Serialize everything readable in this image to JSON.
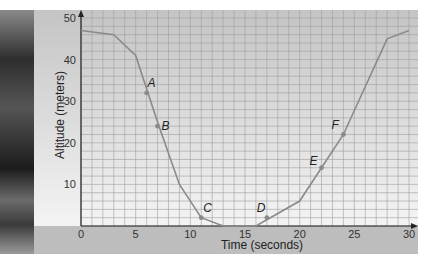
{
  "chart_data": {
    "type": "line",
    "title": "",
    "xlabel": "Time (seconds)",
    "ylabel": "Altitude (meters)",
    "xlim": [
      0,
      30
    ],
    "ylim": [
      0,
      50
    ],
    "xticks": [
      0,
      5,
      10,
      15,
      20,
      25,
      30
    ],
    "yticks": [
      10,
      20,
      30,
      40,
      50
    ],
    "grid": true,
    "legend": null,
    "series": [
      {
        "name": "altitude",
        "x": [
          0,
          3,
          5,
          7,
          9,
          11,
          13,
          16,
          20,
          22,
          24,
          28,
          30
        ],
        "y": [
          47,
          46,
          41,
          25,
          10,
          2,
          0,
          0,
          6,
          14,
          22,
          45,
          47
        ]
      }
    ],
    "annotations": [
      {
        "label": "A",
        "x": 6,
        "y": 32
      },
      {
        "label": "B",
        "x": 7,
        "y": 24
      },
      {
        "label": "C",
        "x": 11,
        "y": 2
      },
      {
        "label": "D",
        "x": 17,
        "y": 2
      },
      {
        "label": "E",
        "x": 22,
        "y": 14
      },
      {
        "label": "F",
        "x": 24,
        "y": 22
      }
    ]
  }
}
